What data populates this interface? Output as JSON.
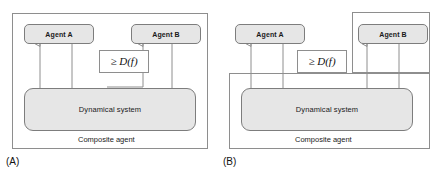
{
  "figure": {
    "type": "diagram",
    "panels": [
      {
        "tag": "(A)",
        "nodes": [
          {
            "id": "agent-a",
            "label": "Agent A"
          },
          {
            "id": "agent-b",
            "label": "Agent B"
          },
          {
            "id": "dynamical-system",
            "label": "Dynamical system"
          }
        ],
        "frames": [
          {
            "id": "composite-agent",
            "label": "Composite agent"
          }
        ],
        "annotations": [
          {
            "id": "coupling-bound",
            "relation": "≥",
            "symbol": "D",
            "argument": "f",
            "text": "≥ D(f)"
          }
        ]
      },
      {
        "tag": "(B)",
        "nodes": [
          {
            "id": "agent-a",
            "label": "Agent A"
          },
          {
            "id": "agent-b",
            "label": "Agent B"
          },
          {
            "id": "dynamical-system",
            "label": "Dynamical system"
          }
        ],
        "frames": [
          {
            "id": "composite-agent",
            "label": "Composite agent"
          },
          {
            "id": "agent-b-enclosure",
            "label": ""
          }
        ],
        "annotations": [
          {
            "id": "coupling-bound",
            "relation": "≥",
            "symbol": "D",
            "argument": "f",
            "text": "≥ D(f)"
          }
        ]
      }
    ],
    "colors": {
      "node_fill": "#e6e6e6",
      "stroke": "#8e8e8e",
      "node_stroke": "#7d7d7d",
      "text": "#1a1a1a",
      "background": "#ffffff"
    }
  }
}
